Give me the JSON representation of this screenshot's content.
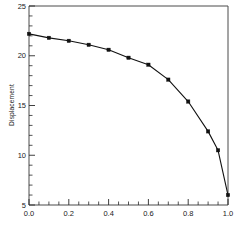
{
  "chart_data": {
    "type": "line",
    "title": "",
    "subtitle": "",
    "xlabel": "",
    "ylabel": "Displacement",
    "xlim": [
      0.0,
      1.0
    ],
    "ylim": [
      5,
      25
    ],
    "grid": false,
    "legend": null,
    "x_ticks": [
      0.0,
      0.2,
      0.4,
      0.6,
      0.8,
      1.0
    ],
    "x_tick_labels": [
      "0.0",
      "0.2",
      "0.4",
      "0.6",
      "0.8",
      "1.0"
    ],
    "x_minor_tick_step": 0.05,
    "y_ticks": [
      5,
      10,
      15,
      20,
      25
    ],
    "y_tick_labels": [
      "5",
      "10",
      "15",
      "20",
      "25"
    ],
    "y_minor_tick_step": 1,
    "marker": "filled-square",
    "line_color": "#111111",
    "marker_color": "#111111",
    "frame_color": "#4a4a4a",
    "background_color": "#ffffff",
    "series": [
      {
        "name": "Displacement",
        "x": [
          0.0,
          0.1,
          0.2,
          0.3,
          0.4,
          0.5,
          0.6,
          0.7,
          0.8,
          0.9,
          0.95,
          1.0
        ],
        "values": [
          22.2,
          21.8,
          21.5,
          21.1,
          20.6,
          19.8,
          19.1,
          17.6,
          15.4,
          12.4,
          10.5,
          6.0
        ]
      }
    ]
  },
  "figure": {
    "y_axis_title": "Displacement",
    "x_tick_0": "0.0",
    "x_tick_1": "0.2",
    "x_tick_2": "0.4",
    "x_tick_3": "0.6",
    "x_tick_4": "0.8",
    "x_tick_5": "1.0",
    "y_tick_0": "5",
    "y_tick_1": "10",
    "y_tick_2": "15",
    "y_tick_3": "20",
    "y_tick_4": "25"
  }
}
